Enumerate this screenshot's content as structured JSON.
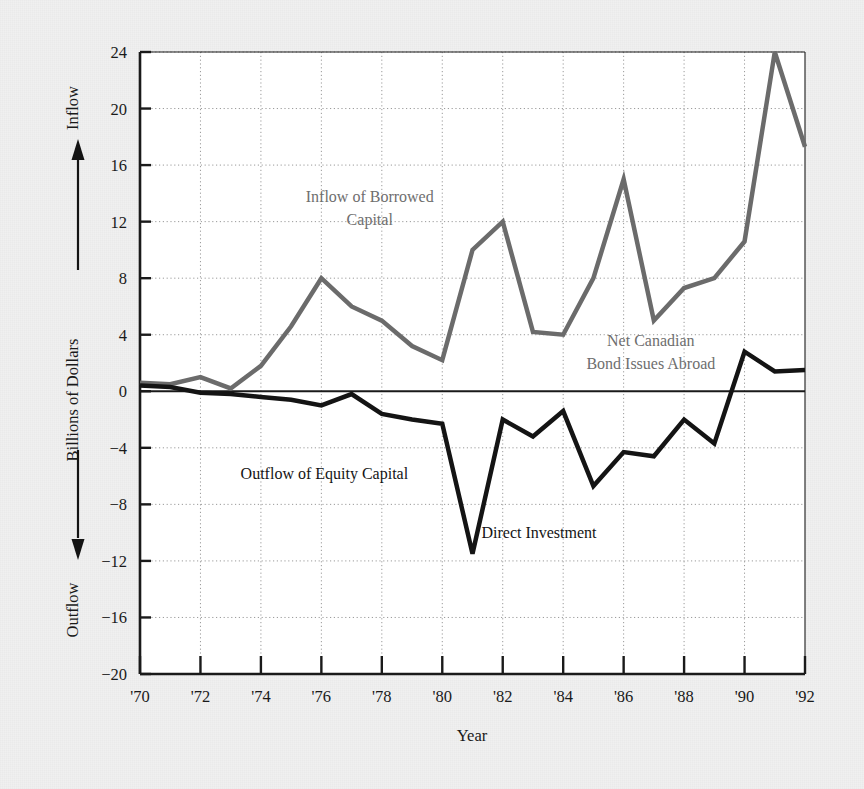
{
  "figure": {
    "background_color": "#f0f0f0",
    "plot_background_color": "#ffffff"
  },
  "chart_data": {
    "type": "line",
    "title": "",
    "subtitle": "",
    "xlabel": "Year",
    "ylabel": "Billions of Dollars",
    "ylabel_top_direction": "Inflow",
    "ylabel_bottom_direction": "Outflow",
    "xlim": [
      1970,
      1992
    ],
    "ylim": [
      -20,
      24
    ],
    "yticks": [
      24,
      20,
      16,
      12,
      8,
      4,
      0,
      -4,
      -8,
      -12,
      -16,
      -20
    ],
    "ytick_labels": [
      "24",
      "20",
      "16",
      "12",
      "8",
      "4",
      "0",
      "−4",
      "−8",
      "−12",
      "−16",
      "−20"
    ],
    "xticks": [
      1970,
      1972,
      1974,
      1976,
      1978,
      1980,
      1982,
      1984,
      1986,
      1988,
      1990,
      1992
    ],
    "xtick_labels": [
      "'70",
      "'72",
      "'74",
      "'76",
      "'78",
      "'80",
      "'82",
      "'84",
      "'86",
      "'88",
      "'90",
      "'92"
    ],
    "grid": true,
    "grid_style": "dotted",
    "zero_line": true,
    "legend_position": "inline-annotations",
    "x": [
      1970,
      1971,
      1972,
      1973,
      1974,
      1975,
      1976,
      1977,
      1978,
      1979,
      1980,
      1981,
      1982,
      1983,
      1984,
      1985,
      1986,
      1987,
      1988,
      1989,
      1990,
      1991,
      1992
    ],
    "series": [
      {
        "name": "Net Canadian Bond Issues Abroad",
        "color": "#6b6b6b",
        "line_width": 4.5,
        "values": [
          0.6,
          0.5,
          1.0,
          0.2,
          1.8,
          4.6,
          8.0,
          6.0,
          5.0,
          3.2,
          2.2,
          10.0,
          12.0,
          4.2,
          4.0,
          8.0,
          15.0,
          5.0,
          7.3,
          8.0,
          10.6,
          24.0,
          17.3
        ]
      },
      {
        "name": "Direct Investment",
        "color": "#141414",
        "line_width": 4.5,
        "values": [
          0.4,
          0.3,
          -0.1,
          -0.2,
          -0.4,
          -0.6,
          -1.0,
          -0.2,
          -1.6,
          -2.0,
          -2.3,
          -11.5,
          -2.0,
          -3.2,
          -1.4,
          -6.7,
          -4.3,
          -4.6,
          -2.0,
          -3.7,
          2.8,
          1.4,
          1.5
        ]
      }
    ],
    "annotations": [
      {
        "text_lines": [
          "Inflow of Borrowed",
          "Capital"
        ],
        "color": "#6e6e6e",
        "x": 1977.6,
        "y": 13.4,
        "anchor": "middle"
      },
      {
        "text_lines": [
          "Net Canadian",
          "Bond Issues Abroad"
        ],
        "color": "#6e6e6e",
        "x": 1986.9,
        "y": 3.2,
        "anchor": "middle"
      },
      {
        "text_lines": [
          "Outflow of Equity Capital"
        ],
        "color": "#141414",
        "x": 1976.1,
        "y": -6.2,
        "anchor": "middle"
      },
      {
        "text_lines": [
          "Direct Investment"
        ],
        "color": "#141414",
        "x": 1983.2,
        "y": -10.4,
        "anchor": "middle"
      }
    ]
  }
}
